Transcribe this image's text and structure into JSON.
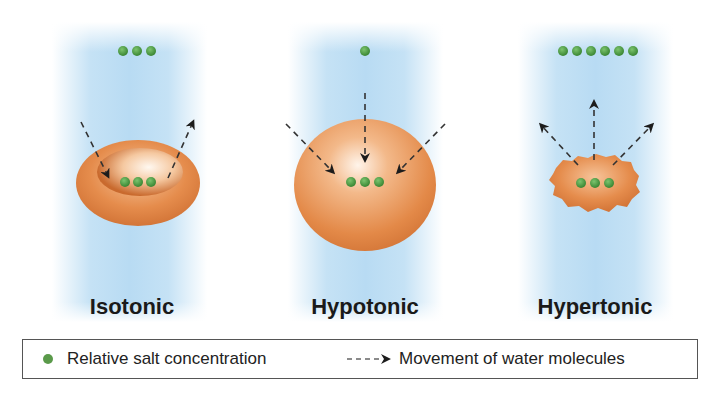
{
  "panels": [
    {
      "label": "Isotonic",
      "outside_salt": 3,
      "inside_salt": 3,
      "cell_shape": "biconcave-disc",
      "water_flow": "balanced"
    },
    {
      "label": "Hypotonic",
      "outside_salt": 1,
      "inside_salt": 3,
      "cell_shape": "swollen-sphere",
      "water_flow": "inward"
    },
    {
      "label": "Hypertonic",
      "outside_salt": 6,
      "inside_salt": 3,
      "cell_shape": "shriveled-crenated",
      "water_flow": "outward"
    }
  ],
  "legend": {
    "salt_label": "Relative salt concentration",
    "water_label": "Movement of water molecules"
  },
  "colors": {
    "salt_dot": "#4e9a45",
    "cell": "#e0874a",
    "background_band": "#b8dbf3",
    "arrow": "#222222"
  }
}
